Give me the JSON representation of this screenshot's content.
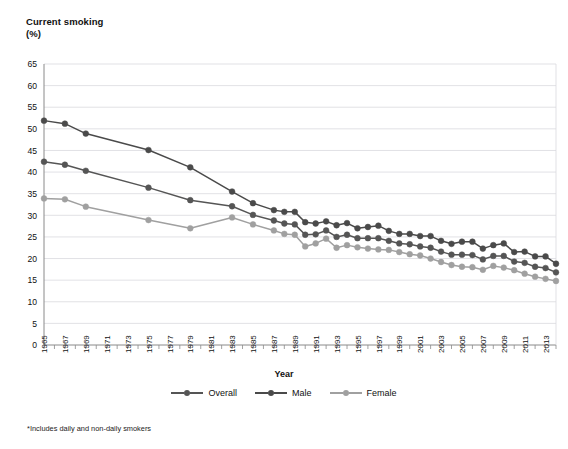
{
  "chart_data": {
    "type": "line",
    "title": "Current smoking (%)",
    "ylabel": "Current smoking (%)",
    "xlabel": "Year",
    "ylim": [
      0,
      65
    ],
    "ytick_step": 5,
    "yticks": [
      0,
      5,
      10,
      15,
      20,
      25,
      30,
      35,
      40,
      45,
      50,
      55,
      60,
      65
    ],
    "grid": true,
    "grid_axis": "y",
    "legend_position": "bottom",
    "xtick_labels": [
      "1965",
      "1967",
      "1969",
      "1971",
      "1973",
      "1975",
      "1977",
      "1979",
      "1981",
      "1983",
      "1985",
      "1987",
      "1989",
      "1991",
      "1993",
      "1995",
      "1997",
      "1999",
      "2001",
      "2003",
      "2005",
      "2007",
      "2009",
      "2011",
      "2013"
    ],
    "x": [
      1965,
      1966,
      1967,
      1968,
      1969,
      1970,
      1971,
      1972,
      1973,
      1974,
      1975,
      1976,
      1977,
      1978,
      1979,
      1980,
      1981,
      1982,
      1983,
      1984,
      1985,
      1986,
      1987,
      1988,
      1989,
      1990,
      1991,
      1992,
      1993,
      1994,
      1995,
      1996,
      1997,
      1998,
      1999,
      2000,
      2001,
      2002,
      2003,
      2004,
      2005,
      2006,
      2007,
      2008,
      2009,
      2010,
      2011,
      2012,
      2013,
      2014
    ],
    "series": [
      {
        "name": "Overall",
        "color": "#555555",
        "values": [
          42.4,
          null,
          41.7,
          null,
          40.3,
          null,
          null,
          null,
          null,
          null,
          36.4,
          null,
          null,
          null,
          33.5,
          null,
          null,
          null,
          32.1,
          null,
          30.1,
          null,
          28.8,
          28.1,
          27.9,
          25.5,
          25.6,
          26.5,
          25.0,
          25.5,
          24.7,
          24.7,
          24.7,
          24.1,
          23.5,
          23.3,
          22.8,
          22.5,
          21.6,
          20.9,
          20.9,
          20.8,
          19.8,
          20.6,
          20.6,
          19.3,
          19.0,
          18.1,
          17.8,
          16.8
        ]
      },
      {
        "name": "Male",
        "color": "#4a4a4a",
        "values": [
          51.9,
          null,
          51.2,
          null,
          48.9,
          null,
          null,
          null,
          null,
          null,
          45.1,
          null,
          null,
          null,
          41.1,
          null,
          null,
          null,
          35.5,
          null,
          32.8,
          null,
          31.2,
          30.8,
          30.8,
          28.4,
          28.1,
          28.6,
          27.7,
          28.2,
          27.0,
          27.3,
          27.6,
          26.4,
          25.7,
          25.7,
          25.2,
          25.2,
          24.1,
          23.4,
          23.9,
          23.9,
          22.3,
          23.1,
          23.5,
          21.5,
          21.6,
          20.5,
          20.5,
          18.8
        ]
      },
      {
        "name": "Female",
        "color": "#a0a0a0",
        "values": [
          33.9,
          null,
          33.7,
          null,
          32.0,
          null,
          null,
          null,
          null,
          null,
          28.9,
          null,
          null,
          null,
          27.0,
          null,
          null,
          null,
          29.5,
          null,
          27.9,
          null,
          26.5,
          25.7,
          25.5,
          22.8,
          23.5,
          24.6,
          22.5,
          23.1,
          22.6,
          22.3,
          22.1,
          22.0,
          21.5,
          21.0,
          20.7,
          20.0,
          19.2,
          18.5,
          18.1,
          18.0,
          17.4,
          18.3,
          17.9,
          17.3,
          16.5,
          15.8,
          15.3,
          14.8
        ]
      }
    ],
    "footnote": "*Includes daily and non-daily smokers",
    "legend_entries": [
      "Overall",
      "Male",
      "Female"
    ]
  },
  "axis": {
    "y_title_line1": "Current smoking",
    "y_title_line2": "(%)",
    "x_title": "Year"
  },
  "legend": {
    "items": [
      {
        "label": "Overall",
        "color": "#555555"
      },
      {
        "label": "Male",
        "color": "#4a4a4a"
      },
      {
        "label": "Female",
        "color": "#a0a0a0"
      }
    ]
  },
  "footnote": {
    "text": "*Includes daily and non-daily smokers"
  },
  "bottom_caption": {
    "text": ""
  },
  "colors": {
    "grid": "#d9d9de",
    "axis": "#8a8a8a",
    "overall": "#555555",
    "male": "#4a4a4a",
    "female": "#a0a0a0",
    "text": "#111111",
    "background": "#ffffff"
  }
}
